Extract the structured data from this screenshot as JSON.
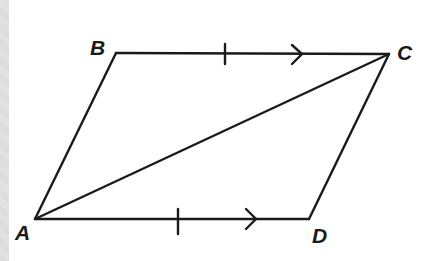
{
  "diagram": {
    "type": "parallelogram",
    "stroke_color": "#1a1a1a",
    "background": "#ffffff",
    "vertices": {
      "A": {
        "label": "A",
        "x": 35,
        "y": 219
      },
      "B": {
        "label": "B",
        "x": 116,
        "y": 53
      },
      "C": {
        "label": "C",
        "x": 389,
        "y": 54
      },
      "D": {
        "label": "D",
        "x": 309,
        "y": 219
      }
    },
    "edges": [
      {
        "from": "A",
        "to": "B"
      },
      {
        "from": "B",
        "to": "C",
        "marks": [
          "equal-tick",
          "parallel-arrow"
        ]
      },
      {
        "from": "C",
        "to": "D"
      },
      {
        "from": "A",
        "to": "D",
        "marks": [
          "equal-tick",
          "parallel-arrow"
        ]
      },
      {
        "from": "A",
        "to": "C",
        "role": "diagonal"
      }
    ],
    "labels": {
      "A": "A",
      "B": "B",
      "C": "C",
      "D": "D"
    }
  }
}
